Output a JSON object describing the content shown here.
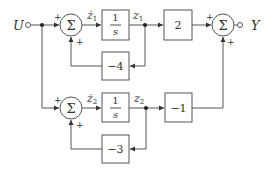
{
  "diagram": {
    "type": "block-diagram",
    "input": {
      "label": "U"
    },
    "output": {
      "label": "Y"
    },
    "summers": [
      {
        "id": "sum1",
        "symbol": "Σ",
        "signs": [
          "+",
          "+"
        ]
      },
      {
        "id": "sum2",
        "symbol": "Σ",
        "signs": [
          "+",
          "+"
        ]
      },
      {
        "id": "sum3",
        "symbol": "Σ",
        "signs": [
          "+",
          "+"
        ]
      }
    ],
    "blocks": [
      {
        "id": "int1",
        "num": "1",
        "den": "s"
      },
      {
        "id": "gain2",
        "label": "2"
      },
      {
        "id": "fb1",
        "label": "−4"
      },
      {
        "id": "int2",
        "num": "1",
        "den": "s"
      },
      {
        "id": "gainm1",
        "label": "−1"
      },
      {
        "id": "fb2",
        "label": "−3"
      }
    ],
    "signals": {
      "z1dot": "ż",
      "z1dot_sub": "1",
      "z1": "z",
      "z1_sub": "1",
      "z2dot": "ż",
      "z2dot_sub": "2",
      "z2": "z",
      "z2_sub": "2"
    }
  }
}
